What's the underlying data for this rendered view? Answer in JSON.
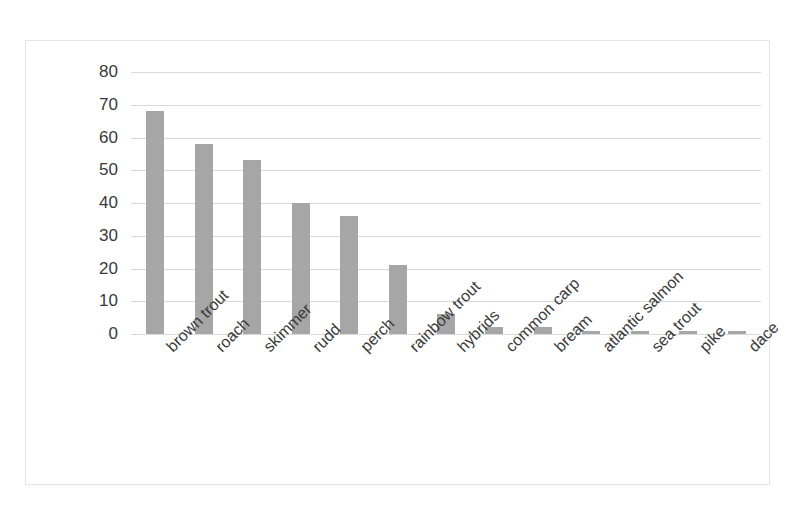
{
  "chart_data": {
    "type": "bar",
    "title": "",
    "subtitle": "",
    "xlabel": "",
    "ylabel": "",
    "categories": [
      "brown trout",
      "roach",
      "skimmer",
      "rudd",
      "perch",
      "rainbow trout",
      "hybrids",
      "common carp",
      "bream",
      "atlantic salmon",
      "sea trout",
      "pike",
      "dace"
    ],
    "values": [
      68,
      58,
      53,
      40,
      36,
      21,
      6,
      2,
      2,
      1,
      1,
      1,
      1
    ],
    "ylim": [
      0,
      80
    ],
    "ytick_labels": [
      "80",
      "70",
      "60",
      "50",
      "40",
      "30",
      "20",
      "10",
      "0"
    ],
    "ytick_values": [
      80,
      70,
      60,
      50,
      40,
      30,
      20,
      10,
      0
    ],
    "grid": true,
    "legend": false,
    "legend_position": "none",
    "bar_color": "#a6a6a6",
    "gridline_color": "#d9d9d9",
    "border_color": "#e4e4e4",
    "text_color": "#3a3a3a",
    "xlabel_rotation": -45
  }
}
